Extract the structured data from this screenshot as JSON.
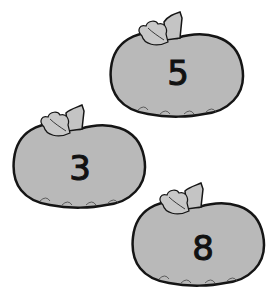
{
  "colors": {
    "fill": "#b9b9b9",
    "outline": "#151515",
    "leaf": "#c4c4c4",
    "background": "#ffffff"
  },
  "pumpkins": [
    {
      "label": "5",
      "x": 108,
      "y": 8,
      "w": 138,
      "h": 112
    },
    {
      "label": "3",
      "x": 12,
      "y": 101,
      "w": 136,
      "h": 110
    },
    {
      "label": "8",
      "x": 131,
      "y": 179,
      "w": 136,
      "h": 110
    }
  ]
}
